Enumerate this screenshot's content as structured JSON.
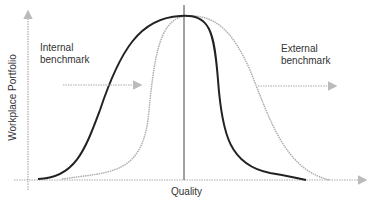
{
  "diagram": {
    "y_axis_label": "Workplace Portfolio",
    "x_axis_label": "Quality",
    "internal_label_1": "Internal",
    "internal_label_2": "benchmark",
    "external_label_1": "External",
    "external_label_2": "benchmark",
    "colors": {
      "dark_curve": "#222222",
      "light_curve": "#aaaaaa",
      "axis": "#999999",
      "arrow": "#aaaaaa"
    }
  }
}
